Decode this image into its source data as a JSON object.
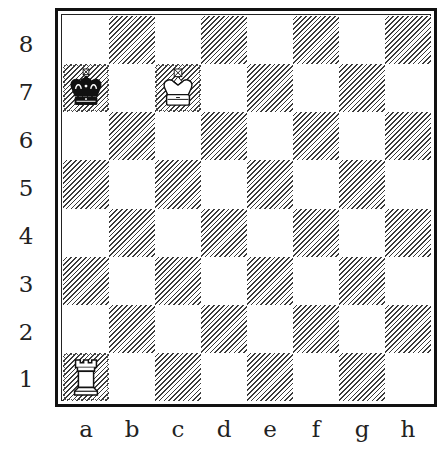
{
  "diagram": {
    "type": "chess-position",
    "files": [
      "a",
      "b",
      "c",
      "d",
      "e",
      "f",
      "g",
      "h"
    ],
    "ranks": [
      "8",
      "7",
      "6",
      "5",
      "4",
      "3",
      "2",
      "1"
    ],
    "pieces": [
      {
        "square": "a7",
        "piece": "king",
        "color": "black",
        "glyph": "♚"
      },
      {
        "square": "c7",
        "piece": "king",
        "color": "white",
        "glyph": "♔"
      },
      {
        "square": "a1",
        "piece": "rook",
        "color": "white",
        "glyph": "♖"
      }
    ],
    "colors": {
      "light_square": "#ffffff",
      "dark_square_hatch": "#3a3a3a",
      "frame": "#111111"
    }
  }
}
